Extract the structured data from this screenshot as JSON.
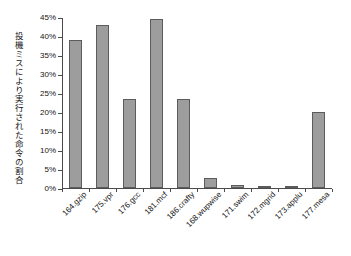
{
  "chart_data": {
    "type": "bar",
    "title": "",
    "subtitle": "",
    "xlabel": "",
    "ylabel": "投機ミスにより実行された命令の割合",
    "categories": [
      "164.gzip",
      "175.vpr",
      "176.gcc",
      "181.mcf",
      "186.crafty",
      "168.wupwise",
      "171.swim",
      "172.mgrid",
      "173.applu",
      "177.mesa"
    ],
    "values": [
      39,
      43,
      23.5,
      44.5,
      23.5,
      2.7,
      0.8,
      0.6,
      0.4,
      20
    ],
    "ylim": [
      0,
      45
    ],
    "ytick_values": [
      0,
      5,
      10,
      15,
      20,
      25,
      30,
      35,
      40,
      45
    ],
    "ytick_labels": [
      "0%",
      "5%",
      "10%",
      "15%",
      "20%",
      "25%",
      "30%",
      "35%",
      "40%",
      "45%"
    ],
    "grid": false,
    "legend": false,
    "legend_position": "none",
    "bar_fill_color": "#9d9d9d",
    "bar_border_color": "#5c5c5c",
    "axis_color": "#4a4a4a",
    "background_color": "#ffffff",
    "text_color": "#141414"
  }
}
